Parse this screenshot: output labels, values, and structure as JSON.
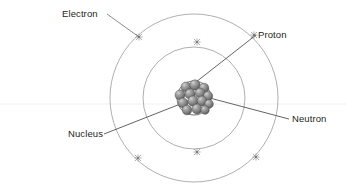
{
  "diagram": {
    "background_color": "#ffffff",
    "width": 346,
    "height": 185,
    "center": {
      "x": 194,
      "y": 98
    }
  },
  "labels": {
    "electron": "Electron",
    "proton": "Proton",
    "nucleus": "Nucleus",
    "neutron": "Neutron"
  },
  "label_positions": {
    "electron": {
      "x": 62,
      "y": 17
    },
    "proton": {
      "x": 258,
      "y": 38
    },
    "nucleus": {
      "x": 68,
      "y": 137
    },
    "neutron": {
      "x": 292,
      "y": 122
    }
  },
  "leader_lines": [
    {
      "name": "electron-leader",
      "x1": 107,
      "y1": 14,
      "x2": 139,
      "y2": 37
    },
    {
      "name": "proton-leader",
      "x1": 256,
      "y1": 35,
      "x2": 196,
      "y2": 82
    },
    {
      "name": "nucleus-leader",
      "x1": 104,
      "y1": 134,
      "x2": 188,
      "y2": 101
    },
    {
      "name": "neutron-leader",
      "x1": 289,
      "y1": 119,
      "x2": 206,
      "y2": 97
    }
  ],
  "orbits": [
    {
      "name": "outer-orbit",
      "cx": 194,
      "cy": 98,
      "r": 84,
      "stroke": "#8c8c8c"
    },
    {
      "name": "inner-orbit",
      "cx": 194,
      "cy": 98,
      "r": 51,
      "stroke": "#8c8c8c"
    }
  ],
  "electron_markers": [
    {
      "orbit": "outer",
      "x": 139,
      "y": 37
    },
    {
      "orbit": "outer",
      "x": 254,
      "y": 35
    },
    {
      "orbit": "outer",
      "x": 138,
      "y": 158
    },
    {
      "orbit": "outer",
      "x": 256,
      "y": 157
    },
    {
      "orbit": "inner",
      "x": 197,
      "y": 42
    },
    {
      "orbit": "inner",
      "x": 197,
      "y": 152
    }
  ],
  "nucleus": {
    "name": "nucleus-cluster",
    "cx": 194,
    "cy": 98,
    "r": 17,
    "outline_color": "#4a4a4a",
    "particle_count": 14,
    "particle_color_light": "#b9b9b9",
    "particle_color_mid": "#8a8a8a",
    "particle_color_dark": "#5e5e5e",
    "particles": [
      {
        "cx": 186,
        "cy": 87,
        "r": 5.0
      },
      {
        "cx": 195,
        "cy": 85,
        "r": 5.2
      },
      {
        "cx": 204,
        "cy": 88,
        "r": 4.8
      },
      {
        "cx": 180,
        "cy": 95,
        "r": 5.0
      },
      {
        "cx": 190,
        "cy": 94,
        "r": 5.1
      },
      {
        "cx": 200,
        "cy": 93,
        "r": 4.9
      },
      {
        "cx": 208,
        "cy": 96,
        "r": 4.7
      },
      {
        "cx": 183,
        "cy": 103,
        "r": 5.0
      },
      {
        "cx": 193,
        "cy": 101,
        "r": 5.2
      },
      {
        "cx": 202,
        "cy": 101,
        "r": 4.9
      },
      {
        "cx": 209,
        "cy": 104,
        "r": 4.4
      },
      {
        "cx": 187,
        "cy": 110,
        "r": 4.8
      },
      {
        "cx": 197,
        "cy": 109,
        "r": 5.0
      },
      {
        "cx": 205,
        "cy": 110,
        "r": 4.3
      }
    ]
  },
  "baseline_rule": {
    "name": "faint-horizontal-rule",
    "y": 104,
    "color": "#f0f0f0"
  }
}
